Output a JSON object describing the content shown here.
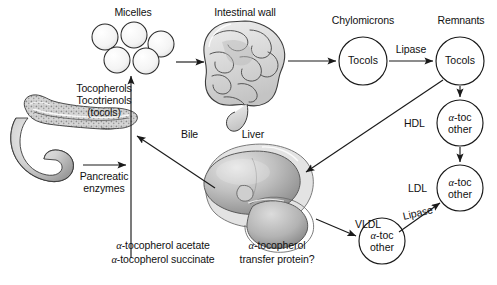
{
  "figure": {
    "background": "#ffffff",
    "stroke_color": "#1a1a1a",
    "organ_fill": "#d9d9d9",
    "organ_shadow": "#8f8f8f",
    "circle_fill": "#ffffff"
  },
  "labels": {
    "micelles": "Micelles",
    "intestinal_wall": "Intestinal wall",
    "chylomicrons": "Chylomicrons",
    "remnants": "Remnants",
    "lipase_top": "Lipase",
    "lipase_bottom": "Lipase",
    "hdl": "HDL",
    "ldl": "LDL",
    "vldl": "VLDL",
    "bile": "Bile",
    "liver": "Liver",
    "tocopherols": "Tocopherols",
    "tocotrienols": "Tocotrienols",
    "tocols_paren": "(tocols)",
    "pancreatic": "Pancreatic",
    "enzymes": "enzymes",
    "acetate_alpha": "α",
    "acetate_rest": "-tocopherol acetate",
    "succinate_alpha": "α",
    "succinate_rest": "-tocopherol succinate",
    "ttp_line1_alpha": "α",
    "ttp_line1_rest": "-tocopherol",
    "ttp_line2": "transfer protein?"
  },
  "nodes": [
    {
      "id": "chylomicron-tocols",
      "label": "Tocols",
      "cx": 363,
      "cy": 61,
      "r": 24
    },
    {
      "id": "remnant-tocols",
      "label": "Tocols",
      "cx": 460,
      "cy": 61,
      "r": 24
    },
    {
      "id": "hdl-particle",
      "line1_alpha": "α",
      "line1_rest": "-toc",
      "line2": "other",
      "cx": 460,
      "cy": 123,
      "r": 23
    },
    {
      "id": "ldl-particle",
      "line1_alpha": "α",
      "line1_rest": "-toc",
      "line2": "other",
      "cx": 460,
      "cy": 188,
      "r": 23
    },
    {
      "id": "vldl-particle",
      "line1_alpha": "α",
      "line1_rest": "-toc",
      "line2": "other",
      "cx": 382,
      "cy": 241,
      "r": 23
    }
  ],
  "micelles": [
    {
      "cx": 105,
      "cy": 37,
      "r": 13
    },
    {
      "cx": 134,
      "cy": 35,
      "r": 13
    },
    {
      "cx": 161,
      "cy": 44,
      "r": 13
    },
    {
      "cx": 117,
      "cy": 60,
      "r": 13
    },
    {
      "cx": 146,
      "cy": 61,
      "r": 13
    }
  ],
  "organs": [
    {
      "id": "pancreas",
      "name": "pancreas-illustration"
    },
    {
      "id": "intestine",
      "name": "intestine-illustration"
    },
    {
      "id": "liver",
      "name": "liver-illustration"
    }
  ],
  "arrows": [
    {
      "id": "tocols-to-micelles",
      "from": "pancreas-output",
      "to": "micelles"
    },
    {
      "id": "bile-to-micelles",
      "from": "liver",
      "to": "micelles"
    },
    {
      "id": "pancreatic-enzymes",
      "from": "pancreas",
      "to": "tocols-stem"
    },
    {
      "id": "micelles-to-intestine",
      "from": "micelles",
      "to": "intestinal-wall"
    },
    {
      "id": "intestine-to-chylomicrons",
      "from": "intestinal-wall",
      "to": "chylomicron-tocols"
    },
    {
      "id": "chylomicrons-to-remnants",
      "from": "chylomicron-tocols",
      "to": "remnant-tocols"
    },
    {
      "id": "remnants-to-liver",
      "from": "remnant-tocols",
      "to": "liver"
    },
    {
      "id": "remnants-to-hdl",
      "from": "remnant-tocols",
      "to": "hdl-particle"
    },
    {
      "id": "hdl-to-ldl",
      "from": "hdl-particle",
      "to": "ldl-particle"
    },
    {
      "id": "liver-to-vldl",
      "from": "liver",
      "to": "vldl-particle"
    },
    {
      "id": "vldl-to-ldl",
      "from": "vldl-particle",
      "to": "ldl-particle"
    }
  ]
}
